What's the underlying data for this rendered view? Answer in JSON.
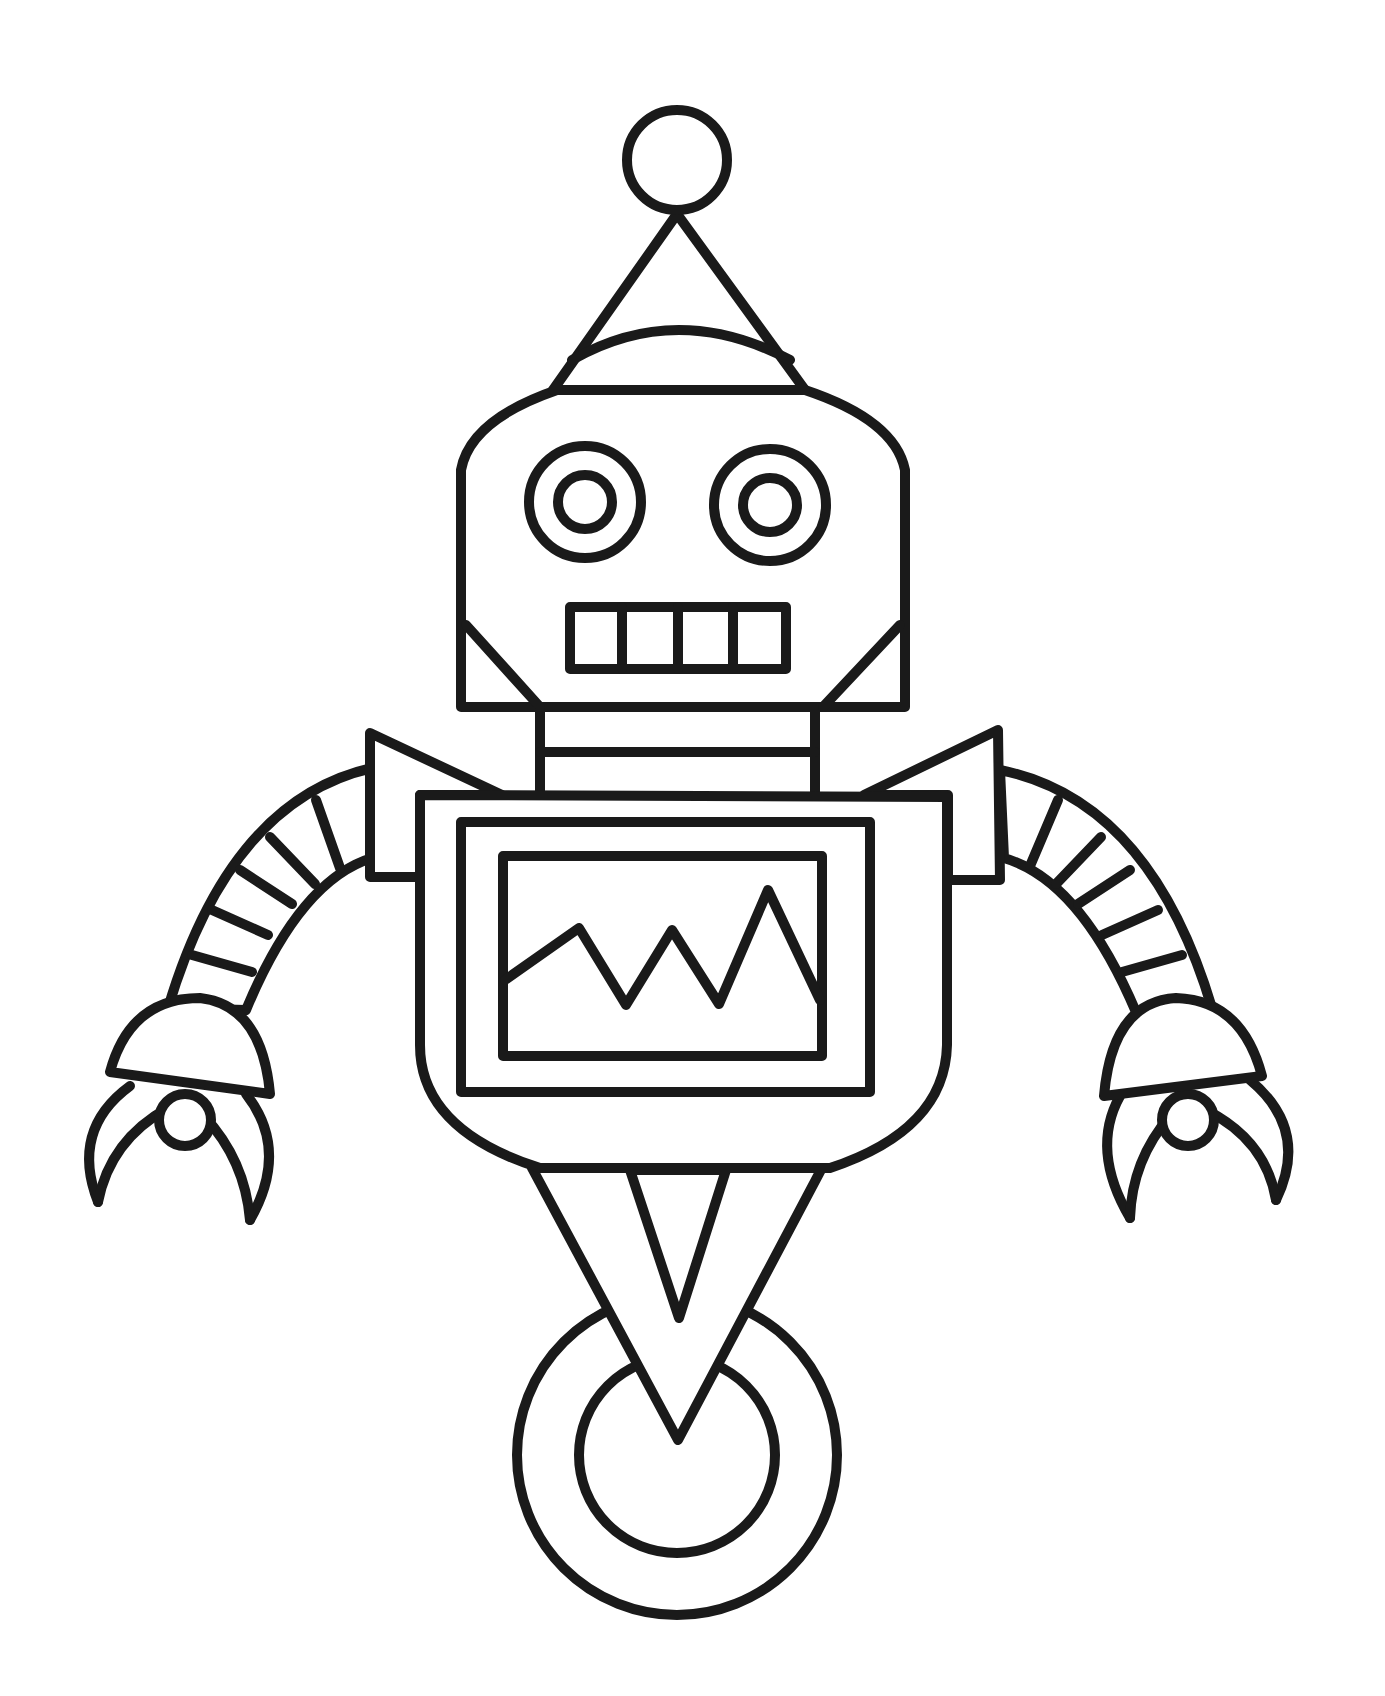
{
  "page": {
    "title": "Robot coloring page",
    "background": "#ffffff",
    "line_color": "#1a1a1a",
    "line_width": 10
  },
  "robot": {
    "antenna": {
      "ball": {
        "cx": 677,
        "cy": 160,
        "r": 50
      },
      "cone": {
        "apex": [
          677,
          214
        ],
        "left": [
          553,
          390
        ],
        "right": [
          805,
          390
        ]
      }
    },
    "head": {
      "top_y": 390,
      "left_x": 461,
      "right_x": 905,
      "bottom_y": 707,
      "eyes": [
        {
          "cx": 585,
          "cy": 502,
          "r_outer": 56,
          "r_inner": 27
        },
        {
          "cx": 770,
          "cy": 505,
          "r_outer": 56,
          "r_inner": 27
        }
      ],
      "mouth": {
        "x": 570,
        "y": 607,
        "w": 216,
        "h": 62,
        "teeth": 4
      }
    },
    "neck": {
      "left_x": 540,
      "right_x": 815,
      "stripes_y": [
        752
      ]
    },
    "body": {
      "top_y": 795,
      "left_x": 418,
      "right_x": 947,
      "bottom_y": 1168
    },
    "screen": {
      "outer": {
        "x": 461,
        "y": 822,
        "w": 409,
        "h": 270
      },
      "inner": {
        "x": 503,
        "y": 856,
        "w": 319,
        "h": 200
      },
      "wave": [
        [
          505,
          980
        ],
        [
          579,
          928
        ],
        [
          626,
          1005
        ],
        [
          672,
          930
        ],
        [
          719,
          1004
        ],
        [
          768,
          890
        ],
        [
          820,
          1000
        ]
      ]
    },
    "wheel": {
      "cx": 677,
      "cy": 1455,
      "r_outer": 160,
      "r_inner": 98
    },
    "arm_segments": 6
  }
}
